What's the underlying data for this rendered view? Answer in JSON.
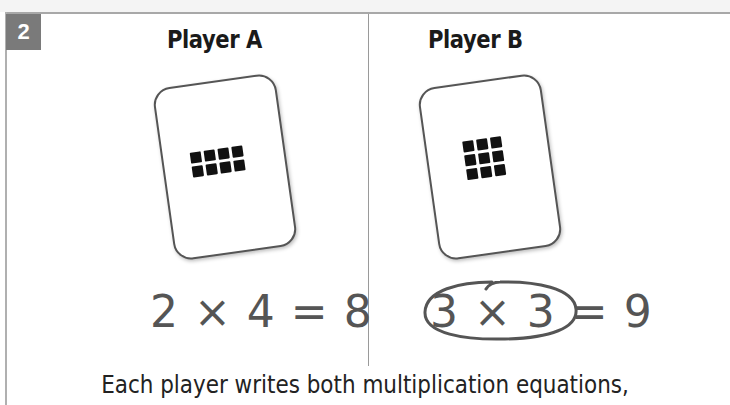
{
  "step": {
    "number": "2"
  },
  "players": [
    {
      "name": "Player A",
      "card": {
        "rows": 2,
        "cols": 4,
        "dot_count": 8
      },
      "equation": "2 × 4 = 8",
      "circled": false
    },
    {
      "name": "Player B",
      "card": {
        "rows": 3,
        "cols": 3,
        "dot_count": 9
      },
      "equation": "3 × 3 = 9",
      "circled": true
    }
  ],
  "caption": "Each player writes both multiplication equations,",
  "colors": {
    "badge_bg": "#7a7a7a",
    "badge_text": "#ffffff",
    "equation_text": "#555555",
    "circle_stroke": "#555555",
    "dot": "#111111"
  }
}
